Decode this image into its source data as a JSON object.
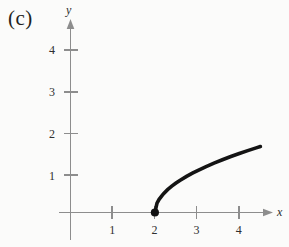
{
  "figure": {
    "panel_label": "(c)",
    "background_color": "#fbfbfa",
    "curve_color": "#141414",
    "axis_color": "#8d8d8d"
  },
  "chart_data": {
    "type": "line",
    "title": "(c)",
    "xlabel": "x",
    "ylabel": "y",
    "equation": "y = sqrt(x - 2)",
    "xlim": [
      -0.25,
      4.85
    ],
    "ylim": [
      -0.7,
      4.55
    ],
    "grid": false,
    "legend": null,
    "x_ticks": [
      1,
      2,
      3,
      4
    ],
    "x_tick_labels": [
      "1",
      "2",
      "3",
      "4"
    ],
    "y_ticks": [
      1,
      2,
      3,
      4
    ],
    "y_tick_labels": [
      "1",
      "2",
      "3",
      "4"
    ],
    "series": [
      {
        "name": "y = sqrt(x - 2)",
        "x": [
          2.0,
          2.05,
          2.1,
          2.2,
          2.3,
          2.4,
          2.5,
          2.6,
          2.75,
          2.9,
          3.0,
          3.2,
          3.4,
          3.6,
          3.8,
          4.0,
          4.2,
          4.4,
          4.5
        ],
        "y": [
          0.0,
          0.224,
          0.316,
          0.447,
          0.548,
          0.632,
          0.707,
          0.775,
          0.866,
          0.949,
          1.0,
          1.095,
          1.183,
          1.265,
          1.342,
          1.414,
          1.483,
          1.549,
          1.581
        ]
      }
    ],
    "annotations": [
      {
        "name": "closed-endpoint",
        "type": "filled-point",
        "x": 2,
        "y": 0,
        "label": "(2, 0)"
      }
    ]
  }
}
